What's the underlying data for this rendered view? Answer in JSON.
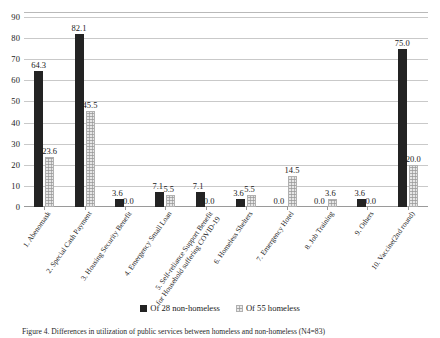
{
  "chart_data": {
    "type": "bar",
    "title": "",
    "xlabel": "",
    "ylabel": "",
    "ylim": [
      0,
      90
    ],
    "ytick_step": 10,
    "yticks": [
      "0",
      "10",
      "20",
      "30",
      "40",
      "50",
      "60",
      "70",
      "80",
      "90"
    ],
    "grid": true,
    "legend_position": "bottom-center",
    "categories": [
      "1. Abenomask",
      "2. Special Cash Payment",
      "3. Housing Security Benefit",
      "4. Emergency Small Loan",
      "5. Self-reliance Support Benefit|for Household suffering COVID-19",
      "6. Homeless Shelters",
      "7. Emergency Hotel",
      "8. Job Training",
      "9. Others",
      "10. Vaccine(2nd round)"
    ],
    "series": [
      {
        "name": "Of 28 non-homeless",
        "color": "#232323",
        "values": [
          64.3,
          82.1,
          3.6,
          7.1,
          7.1,
          3.6,
          0.0,
          0.0,
          3.6,
          75.0
        ],
        "labels": [
          "64.3",
          "82.1",
          "3.6",
          "7.1",
          "7.1",
          "3.6",
          "0.0",
          "0.0",
          "3.6",
          "75.0"
        ]
      },
      {
        "name": "Of 55 homeless",
        "color": "#e6e6e6",
        "values": [
          23.6,
          45.5,
          0.0,
          5.5,
          0.0,
          5.5,
          14.5,
          3.6,
          0.0,
          20.0
        ],
        "labels": [
          "23.6",
          "45.5",
          "0.0",
          "5.5",
          "0.0",
          "5.5",
          "14.5",
          "3.6",
          "0.0",
          "20.0"
        ]
      }
    ]
  },
  "legend": {
    "items": [
      {
        "label": "Of 28 non-homeless"
      },
      {
        "label": "Of 55 homeless"
      }
    ]
  },
  "caption": {
    "text": "Figure 4. Differences in utilization of public services between homeless and non-homeless (N4=83)"
  }
}
